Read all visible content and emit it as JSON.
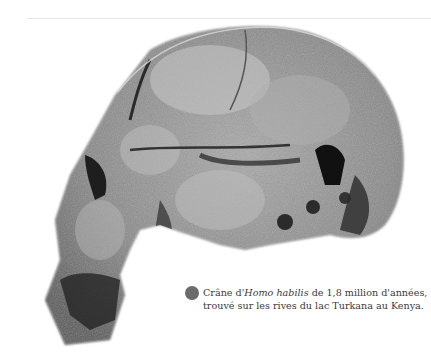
{
  "figure": {
    "image_alt": "Fossil skull of Homo habilis",
    "caption": {
      "part1": "Crâne d'",
      "species": "Homo habilis",
      "part2": " de 1,8 million d'années,",
      "line2": "trouvé sur les rives du lac Turkana au Kenya."
    },
    "bullet_color": "#6b6b6b"
  }
}
